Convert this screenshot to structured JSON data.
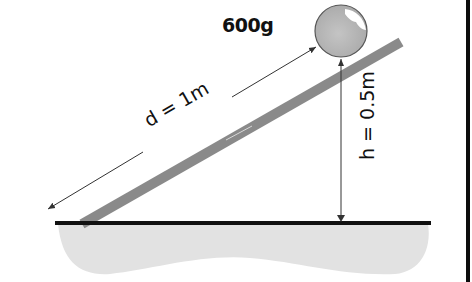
{
  "diagram": {
    "type": "inclined-plane",
    "mass_label": "600g",
    "distance_label": "d = 1m",
    "height_label": "h = 0.5m",
    "colors": {
      "ball_fill": "#b9b9b9",
      "ball_highlight": "#ffffff",
      "ramp": "#8a8a8a",
      "ground_line": "#111111",
      "ground_fill": "#e2e2e2",
      "arrows": "#333333",
      "border": "#0d0d0d"
    }
  }
}
